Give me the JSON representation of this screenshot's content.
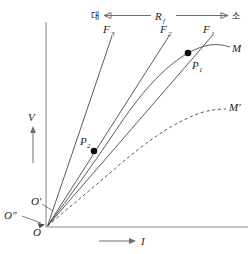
{
  "figure": {
    "axes": {
      "y_label": "V",
      "x_label": "I",
      "y_axis_name": "voltage-axis",
      "x_axis_name": "current-axis"
    },
    "top_scale": {
      "label": "R",
      "label_sub": "f",
      "left_end": "대",
      "right_end": "소"
    },
    "load_lines": [
      {
        "id": "F3",
        "label": "F",
        "sub": "3"
      },
      {
        "id": "F2",
        "label": "F",
        "sub": "2"
      },
      {
        "id": "F1",
        "label": "F",
        "sub": "1"
      }
    ],
    "curves": [
      {
        "id": "M",
        "label": "M",
        "style": "solid"
      },
      {
        "id": "Mprime",
        "label": "M′",
        "style": "dashed"
      }
    ],
    "points": [
      {
        "id": "P1",
        "label": "P",
        "sub": "1"
      },
      {
        "id": "P2",
        "label": "P",
        "sub": "2"
      }
    ],
    "origins": [
      {
        "id": "O",
        "label": "O"
      },
      {
        "id": "Oprime",
        "label": "O′"
      },
      {
        "id": "Odprime",
        "label": "O″"
      }
    ],
    "colors": {
      "axis": "#8c8c8c",
      "curve": "#4a4a4a",
      "point": "#0d0d0d",
      "text": "#1a1a1a",
      "background": "#ffffff"
    }
  }
}
